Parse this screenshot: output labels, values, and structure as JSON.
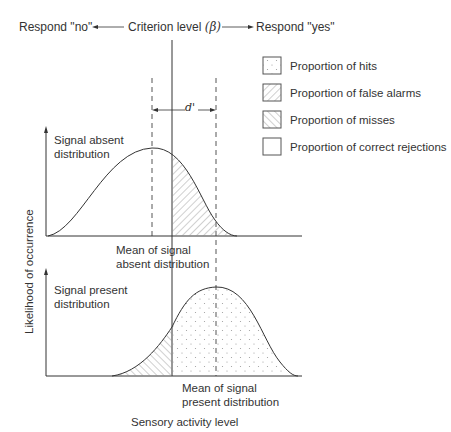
{
  "header": {
    "respond_no": "Respond \"no\"",
    "criterion_label": "Criterion level",
    "criterion_symbol": "(β)",
    "respond_yes": "Respond \"yes\""
  },
  "legend": {
    "items": [
      {
        "pattern": "dots",
        "label": "Proportion of hits"
      },
      {
        "pattern": "hatch-forward",
        "label": "Proportion of false alarms"
      },
      {
        "pattern": "hatch-backward",
        "label": "Proportion of misses"
      },
      {
        "pattern": "blank",
        "label": "Proportion of correct rejections"
      }
    ]
  },
  "separation": {
    "label": "d'"
  },
  "upper_panel": {
    "title_line1": "Signal absent",
    "title_line2": "distribution",
    "mean_label_line1": "Mean of signal",
    "mean_label_line2": "absent distribution"
  },
  "lower_panel": {
    "title_line1": "Signal present",
    "title_line2": "distribution",
    "mean_label_line1": "Mean of signal",
    "mean_label_line2": "present distribution"
  },
  "axes": {
    "ylabel": "Likelihood of occurrence",
    "xlabel": "Sensory activity level"
  },
  "colors": {
    "line": "#333333",
    "hatch": "#8a8a8a",
    "dots": "#9a9a9a"
  }
}
